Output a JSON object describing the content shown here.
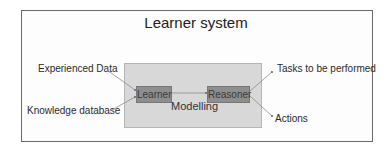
{
  "diagram": {
    "title": "Learner system",
    "inputs": [
      "Experienced Data",
      "Knowledge database"
    ],
    "nodes": {
      "learner": "Learner",
      "reasoner": "Reasoner"
    },
    "container_label": "Modelling",
    "outputs": [
      "Tasks  to be performed",
      "Actions"
    ]
  }
}
